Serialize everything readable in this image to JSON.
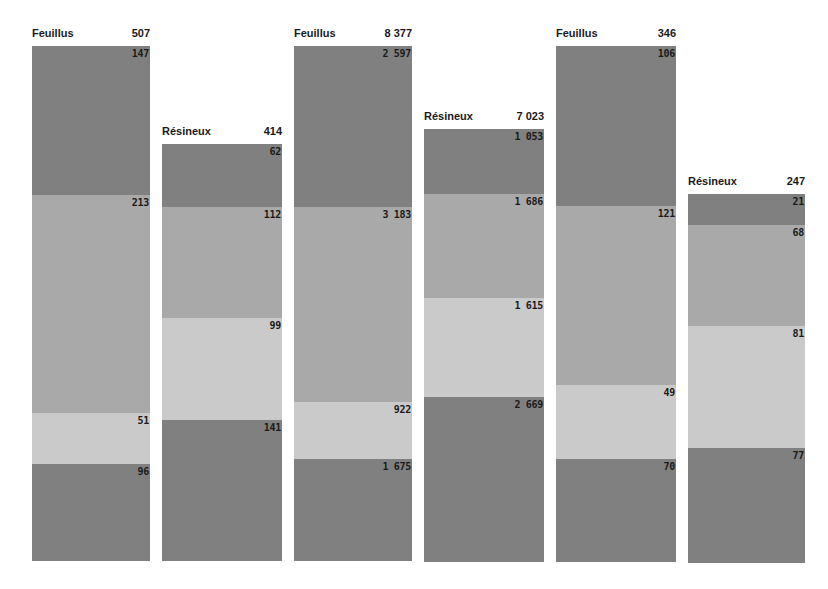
{
  "chart_data": {
    "type": "bar",
    "subtype": "stacked (segmented) columns",
    "title": "",
    "legend": [],
    "grid": false,
    "groups": [
      {
        "category": "Feuillus",
        "total": "507",
        "segments": [
          147,
          213,
          51,
          96
        ]
      },
      {
        "category": "Résineux",
        "total": "414",
        "segments": [
          62,
          112,
          99,
          141
        ]
      },
      {
        "category": "Feuillus",
        "total": "8 377",
        "segments": [
          2597,
          3183,
          922,
          1675
        ]
      },
      {
        "category": "Résineux",
        "total": "7 023",
        "segments": [
          1053,
          1686,
          1615,
          2669
        ]
      },
      {
        "category": "Feuillus",
        "total": "346",
        "segments": [
          106,
          121,
          49,
          70
        ]
      },
      {
        "category": "Résineux",
        "total": "247",
        "segments": [
          21,
          68,
          81,
          77
        ]
      }
    ],
    "segment_colors": [
      "#808080",
      "#a9a9a9",
      "#cacaca",
      "#808080"
    ]
  },
  "bars": [
    {
      "label": "Feuillus",
      "total": "507",
      "left": 32,
      "width": 118,
      "top": 46,
      "bottom": 561,
      "segments": [
        {
          "value": "147",
          "top": 46,
          "color": "dark"
        },
        {
          "value": "213",
          "top": 195,
          "color": "mid"
        },
        {
          "value": "51",
          "top": 413,
          "color": "light"
        },
        {
          "value": "96",
          "top": 464,
          "color": "dark"
        }
      ]
    },
    {
      "label": "Résineux",
      "total": "414",
      "left": 162,
      "width": 120,
      "top": 144,
      "bottom": 561,
      "segments": [
        {
          "value": "62",
          "top": 144,
          "color": "dark"
        },
        {
          "value": "112",
          "top": 207,
          "color": "mid"
        },
        {
          "value": "99",
          "top": 318,
          "color": "light"
        },
        {
          "value": "141",
          "top": 420,
          "color": "dark"
        }
      ]
    },
    {
      "label": "Feuillus",
      "total": "8 377",
      "left": 294,
      "width": 118,
      "top": 46,
      "bottom": 561,
      "segments": [
        {
          "value": "2 597",
          "top": 46,
          "color": "dark"
        },
        {
          "value": "3 183",
          "top": 207,
          "color": "mid"
        },
        {
          "value": "922",
          "top": 402,
          "color": "light"
        },
        {
          "value": "1 675",
          "top": 459,
          "color": "dark"
        }
      ]
    },
    {
      "label": "Résineux",
      "total": "7 023",
      "left": 424,
      "width": 120,
      "top": 129,
      "bottom": 562,
      "segments": [
        {
          "value": "1 053",
          "top": 129,
          "color": "dark"
        },
        {
          "value": "1 686",
          "top": 194,
          "color": "mid"
        },
        {
          "value": "1 615",
          "top": 298,
          "color": "light"
        },
        {
          "value": "2 669",
          "top": 397,
          "color": "dark"
        }
      ]
    },
    {
      "label": "Feuillus",
      "total": "346",
      "left": 556,
      "width": 120,
      "top": 46,
      "bottom": 562,
      "segments": [
        {
          "value": "106",
          "top": 46,
          "color": "dark"
        },
        {
          "value": "121",
          "top": 206,
          "color": "mid"
        },
        {
          "value": "49",
          "top": 385,
          "color": "light"
        },
        {
          "value": "70",
          "top": 459,
          "color": "dark"
        }
      ]
    },
    {
      "label": "Résineux",
      "total": "247",
      "left": 688,
      "width": 117,
      "top": 194,
      "bottom": 563,
      "segments": [
        {
          "value": "21",
          "top": 194,
          "color": "dark"
        },
        {
          "value": "68",
          "top": 225,
          "color": "mid"
        },
        {
          "value": "81",
          "top": 326,
          "color": "light"
        },
        {
          "value": "77",
          "top": 448,
          "color": "dark"
        }
      ]
    }
  ]
}
